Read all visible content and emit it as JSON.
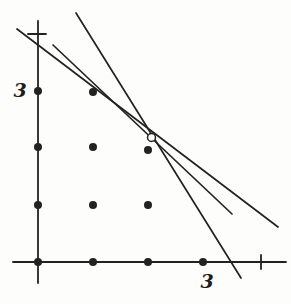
{
  "figure": {
    "width": 291,
    "height": 304,
    "background": "#fdfdfc",
    "ink_color": "#222222",
    "axes": {
      "y_axis": {
        "x": 38,
        "y1": 21,
        "y2": 283
      },
      "x_axis": {
        "y": 262,
        "x1": 13,
        "x2": 286
      },
      "y_tick": {
        "y": 34,
        "x1": 28,
        "x2": 46
      },
      "x_tick": {
        "x": 261,
        "y1": 255,
        "y2": 269
      }
    },
    "axis_labels": [
      {
        "text": "3",
        "x": 20,
        "y": 91,
        "axis": "y"
      },
      {
        "text": "3",
        "x": 207,
        "y": 282,
        "axis": "x"
      }
    ],
    "lines": [
      {
        "name": "line-steep",
        "x1": 76,
        "y1": 13,
        "x2": 241,
        "y2": 278
      },
      {
        "name": "line-middle",
        "x1": 53,
        "y1": 45,
        "x2": 232,
        "y2": 214
      },
      {
        "name": "line-shallow",
        "x1": 17,
        "y1": 29,
        "x2": 278,
        "y2": 227
      }
    ],
    "lattice_dots": [
      {
        "x": 38,
        "y": 91,
        "r": 4
      },
      {
        "x": 93,
        "y": 92,
        "r": 4
      },
      {
        "x": 38,
        "y": 147,
        "r": 4
      },
      {
        "x": 93,
        "y": 147,
        "r": 4
      },
      {
        "x": 148,
        "y": 150,
        "r": 4
      },
      {
        "x": 38,
        "y": 205,
        "r": 4
      },
      {
        "x": 93,
        "y": 205,
        "r": 4
      },
      {
        "x": 148,
        "y": 205,
        "r": 4
      },
      {
        "x": 38,
        "y": 262,
        "r": 4
      },
      {
        "x": 93,
        "y": 262,
        "r": 4
      },
      {
        "x": 148,
        "y": 262,
        "r": 4
      },
      {
        "x": 203,
        "y": 262,
        "r": 4
      }
    ],
    "open_circle": {
      "cx": 151.5,
      "cy": 137.5,
      "r": 4
    }
  }
}
